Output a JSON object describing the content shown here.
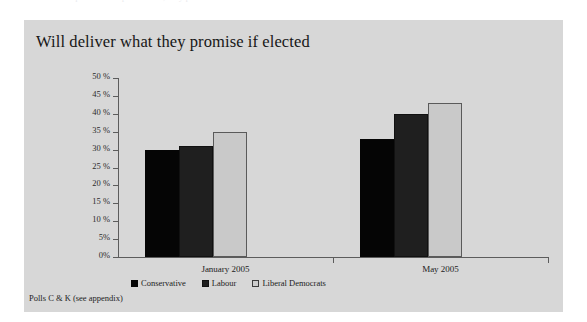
{
  "figure": {
    "title": "Will deliver what they promise if elected",
    "source_note": "Polls C & K (see appendix)",
    "top_bleed_text": "the question was put to them; they promise if elected",
    "panel_color": "#d7d7d7",
    "page_color": "#ffffff"
  },
  "chart_data": {
    "type": "bar",
    "title": "Will deliver what they promise if elected",
    "subtitle": "",
    "xlabel": "",
    "ylabel": "",
    "categories": [
      "January 2005",
      "May 2005"
    ],
    "series": [
      {
        "name": "Conservative",
        "values": [
          30,
          33
        ],
        "color": "#050505"
      },
      {
        "name": "Labour",
        "values": [
          31,
          40
        ],
        "color": "#1f1f1f"
      },
      {
        "name": "Liberal Democrats",
        "values": [
          35,
          43
        ],
        "color": "#c9c9c9"
      }
    ],
    "ylim": [
      0,
      50
    ],
    "ytick_step": 5,
    "ytick_labels": [
      "0%",
      "5%",
      "10 %",
      "15 %",
      "20 %",
      "25 %",
      "30 %",
      "35 %",
      "40 %",
      "45 %",
      "50 %"
    ],
    "ytick_values": [
      0,
      5,
      10,
      15,
      20,
      25,
      30,
      35,
      40,
      45,
      50
    ],
    "unit": "%",
    "grid": false,
    "legend_position": "bottom-left",
    "annotations": [
      "Polls C & K (see appendix)"
    ]
  },
  "legend": {
    "items": [
      {
        "label": "Conservative"
      },
      {
        "label": "Labour"
      },
      {
        "label": "Liberal Democrats"
      }
    ]
  }
}
